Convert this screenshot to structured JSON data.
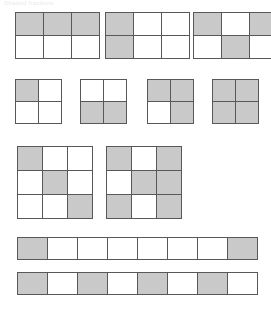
{
  "page": {
    "header_text": "Shaded fractions",
    "background_color": "#ffffff",
    "shaded_color": "#c9c9c9",
    "unshaded_color": "#ffffff",
    "grid_line_color": "#58585a"
  },
  "figures": [
    {
      "row": 1,
      "row_top": 12,
      "items": [
        {
          "name": "grid-1",
          "columns": 3,
          "rows": 2,
          "left": 15,
          "cell_width": 27,
          "cell_height": 22,
          "shaded_count": 3,
          "total_count": 6,
          "fraction": "3/6",
          "cells": [
            1,
            1,
            1,
            0,
            0,
            0
          ]
        },
        {
          "name": "grid-2",
          "columns": 3,
          "rows": 2,
          "left": 105,
          "cell_width": 27,
          "cell_height": 22,
          "shaded_count": 2,
          "total_count": 6,
          "fraction": "2/6",
          "cells": [
            1,
            0,
            0,
            1,
            0,
            0
          ]
        },
        {
          "name": "grid-3",
          "columns": 3,
          "rows": 2,
          "left": 193,
          "cell_width": 27,
          "cell_height": 22,
          "shaded_count": 3,
          "total_count": 6,
          "fraction": "3/6",
          "cells": [
            1,
            0,
            1,
            0,
            1,
            0
          ]
        }
      ]
    },
    {
      "row": 2,
      "row_top": 79,
      "items": [
        {
          "name": "grid-4",
          "columns": 2,
          "rows": 2,
          "left": 15,
          "cell_width": 22,
          "cell_height": 21,
          "shaded_count": 1,
          "total_count": 4,
          "fraction": "1/4",
          "cells": [
            1,
            0,
            0,
            0
          ]
        },
        {
          "name": "grid-5",
          "columns": 2,
          "rows": 2,
          "left": 80,
          "cell_width": 22,
          "cell_height": 21,
          "shaded_count": 2,
          "total_count": 4,
          "fraction": "2/4",
          "cells": [
            0,
            0,
            1,
            1
          ]
        },
        {
          "name": "grid-6",
          "columns": 2,
          "rows": 2,
          "left": 147,
          "cell_width": 22,
          "cell_height": 21,
          "shaded_count": 3,
          "total_count": 4,
          "fraction": "3/4",
          "cells": [
            1,
            1,
            0,
            1
          ]
        },
        {
          "name": "grid-7",
          "columns": 2,
          "rows": 2,
          "left": 212,
          "cell_width": 22,
          "cell_height": 21,
          "shaded_count": 4,
          "total_count": 4,
          "fraction": "4/4",
          "cells": [
            1,
            1,
            1,
            1
          ]
        }
      ]
    },
    {
      "row": 3,
      "row_top": 146,
      "items": [
        {
          "name": "grid-8",
          "columns": 3,
          "rows": 3,
          "left": 17,
          "cell_width": 24,
          "cell_height": 23,
          "shaded_count": 3,
          "total_count": 9,
          "fraction": "3/9",
          "cells": [
            1,
            0,
            0,
            0,
            1,
            0,
            0,
            0,
            1
          ]
        },
        {
          "name": "grid-9",
          "columns": 3,
          "rows": 3,
          "left": 106,
          "cell_width": 24,
          "cell_height": 23,
          "shaded_count": 6,
          "total_count": 9,
          "fraction": "6/9",
          "cells": [
            1,
            0,
            1,
            0,
            1,
            1,
            1,
            0,
            1
          ]
        }
      ]
    },
    {
      "row": 4,
      "row_top": 237,
      "items": [
        {
          "name": "strip-1",
          "columns": 8,
          "rows": 1,
          "left": 17,
          "cell_width": 29,
          "cell_height": 21,
          "shaded_count": 2,
          "total_count": 8,
          "fraction": "2/8",
          "cells": [
            1,
            0,
            0,
            0,
            0,
            0,
            0,
            1
          ]
        }
      ]
    },
    {
      "row": 5,
      "row_top": 272,
      "items": [
        {
          "name": "strip-2",
          "columns": 8,
          "rows": 1,
          "left": 17,
          "cell_width": 29,
          "cell_height": 21,
          "shaded_count": 4,
          "total_count": 8,
          "fraction": "4/8",
          "cells": [
            1,
            0,
            1,
            0,
            1,
            0,
            1,
            0
          ]
        }
      ]
    }
  ]
}
